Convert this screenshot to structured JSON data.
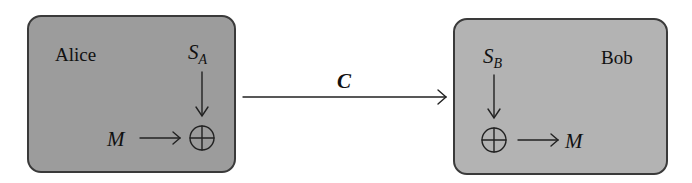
{
  "alice": {
    "name": "Alice",
    "key_symbol": "S",
    "key_subscript": "A",
    "message": "M",
    "operator": "xor",
    "fill": "#9c9c9c"
  },
  "bob": {
    "name": "Bob",
    "key_symbol": "S",
    "key_subscript": "B",
    "message": "M",
    "operator": "xor",
    "fill": "#b3b3b3"
  },
  "channel": {
    "label": "C"
  },
  "colors": {
    "stroke": "#3a3a3a",
    "background": "#ffffff"
  }
}
